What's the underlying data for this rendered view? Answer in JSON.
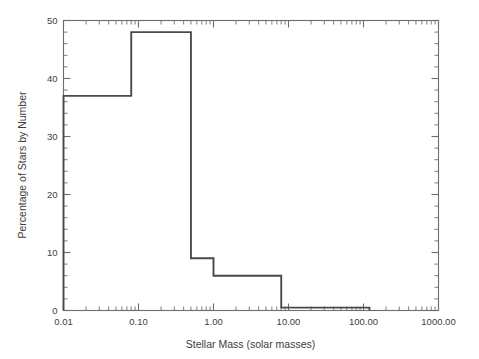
{
  "chart_data": {
    "type": "line",
    "subtype": "step-histogram",
    "title": "",
    "xlabel": "Stellar Mass (solar masses)",
    "ylabel": "Percentage of Stars by Number",
    "xscale": "log",
    "yscale": "linear",
    "xlim": [
      0.01,
      1000.0
    ],
    "ylim": [
      0,
      50
    ],
    "grid": false,
    "legend": null,
    "xticks": [
      0.01,
      0.1,
      1.0,
      10.0,
      100.0,
      1000.0
    ],
    "xticklabels": [
      "0.01",
      "0.10",
      "1.00",
      "10.00",
      "100.00",
      "1000.00"
    ],
    "yticks": [
      0,
      10,
      20,
      30,
      40,
      50
    ],
    "yticklabels": [
      "0",
      "10",
      "20",
      "30",
      "40",
      "50"
    ],
    "yminor_step": 2,
    "xminor": "log-decade-subticks",
    "bins": [
      {
        "x_low": 0.01,
        "x_high": 0.08,
        "value": 37.0
      },
      {
        "x_low": 0.08,
        "x_high": 0.5,
        "value": 48.0
      },
      {
        "x_low": 0.5,
        "x_high": 1.0,
        "value": 9.0
      },
      {
        "x_low": 1.0,
        "x_high": 8.0,
        "value": 6.0
      },
      {
        "x_low": 8.0,
        "x_high": 120.0,
        "value": 0.5
      }
    ],
    "categories": [
      "0.01-0.08",
      "0.08-0.5",
      "0.5-1.0",
      "1.0-8.0",
      "8.0-120.0"
    ],
    "values": [
      37.0,
      48.0,
      9.0,
      6.0,
      0.5
    ],
    "colors": {
      "line": "#4a4a4a",
      "frame": "#6d6d6d",
      "text": "#3d3d3d",
      "background": "#ffffff"
    }
  }
}
